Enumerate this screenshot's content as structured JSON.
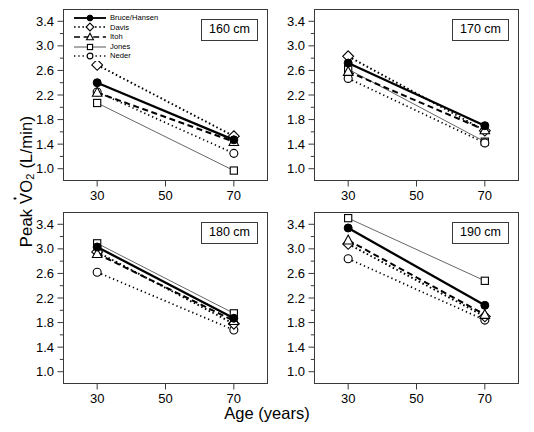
{
  "chart_data": {
    "type": "line",
    "title": "",
    "xlabel": "Age (years)",
    "ylabel": "Peak VO2 (L/min)",
    "ylabel_parts": {
      "prefix": "Peak ",
      "v": "V",
      "o": "O",
      "sub": "2",
      "suffix": " (L/min)"
    },
    "x": [
      30,
      70
    ],
    "xlim": [
      20,
      80
    ],
    "ylim": [
      0.8,
      3.6
    ],
    "xticks": [
      30,
      50,
      70
    ],
    "xtick_labels": [
      "30",
      "50",
      "70"
    ],
    "yticks": [
      1.0,
      1.4,
      1.8,
      2.2,
      2.6,
      3.0,
      3.4
    ],
    "ytick_labels": [
      "1.0",
      "1.4",
      "1.8",
      "2.2",
      "2.6",
      "3.0",
      "3.4"
    ],
    "yminor": [
      1.2,
      1.6,
      2.0,
      2.4,
      2.8,
      3.2
    ],
    "grid": false,
    "legend_position": "top-left-panel-1",
    "legend_entries": [
      {
        "label": "Bruce/Hansen",
        "marker": "filled-circle",
        "line": "solid-thick"
      },
      {
        "label": "Davis",
        "marker": "open-diamond",
        "line": "dotted-coarse"
      },
      {
        "label": "Itoh",
        "marker": "open-triangle",
        "line": "dashed"
      },
      {
        "label": "Jones",
        "marker": "open-square",
        "line": "solid-thin"
      },
      {
        "label": "Neder",
        "marker": "open-circle",
        "line": "dotted-fine"
      }
    ],
    "panels": [
      {
        "tag": "160 cm",
        "series": [
          {
            "name": "Bruce/Hansen",
            "marker": "filled-circle",
            "line": "solid-thick",
            "values": [
              2.4,
              1.47
            ]
          },
          {
            "name": "Davis",
            "marker": "open-diamond",
            "line": "dotted-coarse",
            "values": [
              2.69,
              1.53
            ]
          },
          {
            "name": "Itoh",
            "marker": "open-triangle",
            "line": "dashed",
            "values": [
              2.24,
              1.44
            ]
          },
          {
            "name": "Jones",
            "marker": "open-square",
            "line": "solid-thin",
            "values": [
              2.07,
              0.97
            ]
          },
          {
            "name": "Neder",
            "marker": "open-circle",
            "line": "dotted-fine",
            "values": [
              2.25,
              1.25
            ]
          }
        ]
      },
      {
        "tag": "170 cm",
        "series": [
          {
            "name": "Bruce/Hansen",
            "marker": "filled-circle",
            "line": "solid-thick",
            "values": [
              2.72,
              1.7
            ]
          },
          {
            "name": "Davis",
            "marker": "open-diamond",
            "line": "dotted-coarse",
            "values": [
              2.83,
              1.62
            ]
          },
          {
            "name": "Itoh",
            "marker": "open-triangle",
            "line": "dashed",
            "values": [
              2.58,
              1.63
            ]
          },
          {
            "name": "Jones",
            "marker": "open-square",
            "line": "solid-thin",
            "values": [
              2.62,
              1.44
            ]
          },
          {
            "name": "Neder",
            "marker": "open-circle",
            "line": "dotted-fine",
            "values": [
              2.47,
              1.42
            ]
          }
        ]
      },
      {
        "tag": "180 cm",
        "series": [
          {
            "name": "Bruce/Hansen",
            "marker": "filled-circle",
            "line": "solid-thick",
            "values": [
              3.03,
              1.87
            ]
          },
          {
            "name": "Davis",
            "marker": "open-diamond",
            "line": "dotted-coarse",
            "values": [
              2.95,
              1.78
            ]
          },
          {
            "name": "Itoh",
            "marker": "open-triangle",
            "line": "dashed",
            "values": [
              2.92,
              1.83
            ]
          },
          {
            "name": "Jones",
            "marker": "open-square",
            "line": "solid-thin",
            "values": [
              3.09,
              1.95
            ]
          },
          {
            "name": "Neder",
            "marker": "open-circle",
            "line": "dotted-fine",
            "values": [
              2.62,
              1.68
            ]
          }
        ]
      },
      {
        "tag": "190 cm",
        "series": [
          {
            "name": "Bruce/Hansen",
            "marker": "filled-circle",
            "line": "solid-thick",
            "values": [
              3.34,
              2.08
            ]
          },
          {
            "name": "Davis",
            "marker": "open-diamond",
            "line": "dotted-coarse",
            "values": [
              3.08,
              1.9
            ]
          },
          {
            "name": "Itoh",
            "marker": "open-triangle",
            "line": "dashed",
            "values": [
              3.14,
              1.93
            ]
          },
          {
            "name": "Jones",
            "marker": "open-square",
            "line": "solid-thin",
            "values": [
              3.5,
              2.48
            ]
          },
          {
            "name": "Neder",
            "marker": "open-circle",
            "line": "dotted-fine",
            "values": [
              2.84,
              1.84
            ]
          }
        ]
      }
    ]
  }
}
